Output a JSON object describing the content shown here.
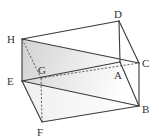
{
  "diagram": {
    "type": "rectangular-prism",
    "vertices": {
      "A": {
        "label": "A",
        "x": 120,
        "y": 62,
        "label_x": 114,
        "label_y": 79
      },
      "B": {
        "label": "B",
        "x": 139,
        "y": 106,
        "label_x": 142,
        "label_y": 113
      },
      "C": {
        "label": "C",
        "x": 139,
        "y": 63,
        "label_x": 142,
        "label_y": 67
      },
      "D": {
        "label": "D",
        "x": 119,
        "y": 21,
        "label_x": 114,
        "label_y": 18
      },
      "E": {
        "label": "E",
        "x": 22,
        "y": 81,
        "label_x": 7,
        "label_y": 85
      },
      "F": {
        "label": "F",
        "x": 42,
        "y": 122,
        "label_x": 37,
        "label_y": 136
      },
      "G": {
        "label": "G",
        "x": 41,
        "y": 78,
        "label_x": 38,
        "label_y": 74
      },
      "H": {
        "label": "H",
        "x": 22,
        "y": 39,
        "label_x": 7,
        "label_y": 43
      }
    },
    "visible_edges": [
      "HD",
      "DC",
      "DA",
      "CB",
      "AB",
      "HE",
      "EF",
      "FB",
      "EA",
      "HC",
      "EB"
    ],
    "hidden_edges": [
      "HG",
      "GF",
      "GC"
    ],
    "shaded_plane": [
      "H",
      "C",
      "B",
      "E"
    ],
    "colors": {
      "line": "#3a3a3a",
      "shade_dark": "#d6d6d6",
      "shade_light": "#ffffff"
    }
  }
}
